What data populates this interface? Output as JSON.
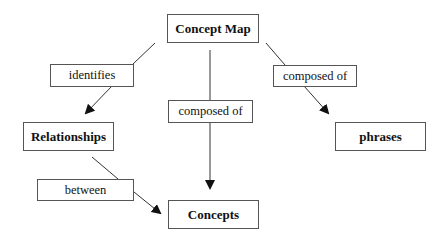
{
  "diagram": {
    "title": "Concept Map",
    "nodes": {
      "concept_map": "Concept Map",
      "relationships": "Relationships",
      "phrases": "phrases",
      "concepts": "Concepts"
    },
    "links": {
      "identifies": "identifies",
      "composed_of_center": "composed of",
      "composed_of_right": "composed of",
      "between": "between"
    },
    "edges": [
      {
        "from": "Concept Map",
        "label": "identifies",
        "to": "Relationships"
      },
      {
        "from": "Concept Map",
        "label": "composed of",
        "to": "Concepts"
      },
      {
        "from": "Concept Map",
        "label": "composed of",
        "to": "phrases"
      },
      {
        "from": "Relationships",
        "label": "between",
        "to": "Concepts"
      }
    ]
  }
}
